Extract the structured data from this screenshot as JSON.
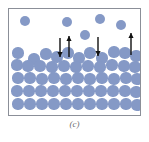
{
  "figure": {
    "caption": "(c)",
    "panel_border_color": "#8b8f98",
    "background_color": "#ffffff",
    "molecule_color": "#8599c6",
    "arrow_color": "#111111",
    "panel": {
      "x": 8,
      "y": 8,
      "width": 133,
      "height": 108
    }
  },
  "chart_data": {
    "type": "scatter",
    "title": "",
    "subtitle": "",
    "xlabel": "",
    "ylabel": "",
    "xlim": [
      0,
      133
    ],
    "ylim": [
      0,
      108
    ],
    "grid": false,
    "legend": [],
    "annotations": [
      "(c)"
    ],
    "series": [
      {
        "name": "vapor-molecules",
        "marker": "circle",
        "color": "#8599c6",
        "radius": 5.2,
        "points": [
          {
            "x": 16,
            "y": 12
          },
          {
            "x": 58,
            "y": 13
          },
          {
            "x": 91,
            "y": 10
          },
          {
            "x": 112,
            "y": 16
          },
          {
            "x": 76,
            "y": 26
          }
        ]
      },
      {
        "name": "liquid-surface-molecules",
        "marker": "circle",
        "color": "#8599c6",
        "radius": 5.6,
        "points": [
          {
            "x": 9,
            "y": 44
          },
          {
            "x": 25,
            "y": 50
          },
          {
            "x": 37,
            "y": 45
          },
          {
            "x": 48,
            "y": 48
          },
          {
            "x": 59,
            "y": 44
          },
          {
            "x": 70,
            "y": 49
          },
          {
            "x": 81,
            "y": 44
          },
          {
            "x": 93,
            "y": 49
          },
          {
            "x": 105,
            "y": 43
          },
          {
            "x": 116,
            "y": 44
          },
          {
            "x": 127,
            "y": 47
          }
        ]
      },
      {
        "name": "liquid-bulk-row-1",
        "marker": "circle",
        "color": "#8599c6",
        "radius": 5.6,
        "points": [
          {
            "x": 8,
            "y": 56
          },
          {
            "x": 19,
            "y": 57
          },
          {
            "x": 31,
            "y": 57
          },
          {
            "x": 43,
            "y": 58
          },
          {
            "x": 55,
            "y": 57
          },
          {
            "x": 67,
            "y": 58
          },
          {
            "x": 79,
            "y": 57
          },
          {
            "x": 91,
            "y": 58
          },
          {
            "x": 103,
            "y": 56
          },
          {
            "x": 115,
            "y": 57
          },
          {
            "x": 126,
            "y": 58
          }
        ]
      },
      {
        "name": "liquid-bulk-row-2",
        "marker": "circle",
        "color": "#8599c6",
        "radius": 5.6,
        "points": [
          {
            "x": 9,
            "y": 69
          },
          {
            "x": 21,
            "y": 69
          },
          {
            "x": 33,
            "y": 70
          },
          {
            "x": 45,
            "y": 69
          },
          {
            "x": 57,
            "y": 70
          },
          {
            "x": 69,
            "y": 69
          },
          {
            "x": 81,
            "y": 70
          },
          {
            "x": 93,
            "y": 69
          },
          {
            "x": 105,
            "y": 70
          },
          {
            "x": 117,
            "y": 69
          },
          {
            "x": 128,
            "y": 70
          }
        ]
      },
      {
        "name": "liquid-bulk-row-3",
        "marker": "circle",
        "color": "#8599c6",
        "radius": 5.6,
        "points": [
          {
            "x": 8,
            "y": 82
          },
          {
            "x": 20,
            "y": 82
          },
          {
            "x": 32,
            "y": 82
          },
          {
            "x": 44,
            "y": 82
          },
          {
            "x": 56,
            "y": 82
          },
          {
            "x": 68,
            "y": 82
          },
          {
            "x": 80,
            "y": 82
          },
          {
            "x": 92,
            "y": 82
          },
          {
            "x": 104,
            "y": 82
          },
          {
            "x": 116,
            "y": 82
          },
          {
            "x": 127,
            "y": 83
          }
        ]
      },
      {
        "name": "liquid-bulk-row-4",
        "marker": "circle",
        "color": "#8599c6",
        "radius": 5.6,
        "points": [
          {
            "x": 9,
            "y": 95
          },
          {
            "x": 21,
            "y": 95
          },
          {
            "x": 33,
            "y": 95
          },
          {
            "x": 45,
            "y": 95
          },
          {
            "x": 57,
            "y": 95
          },
          {
            "x": 69,
            "y": 95
          },
          {
            "x": 81,
            "y": 95
          },
          {
            "x": 93,
            "y": 95
          },
          {
            "x": 105,
            "y": 95
          },
          {
            "x": 117,
            "y": 95
          },
          {
            "x": 128,
            "y": 96
          }
        ]
      }
    ],
    "arrows": [
      {
        "name": "condensation-arrow-left",
        "direction": "down",
        "x": 51,
        "y_start": 29,
        "y_end": 48
      },
      {
        "name": "evaporation-arrow-left",
        "direction": "up",
        "x": 60,
        "y_start": 48,
        "y_end": 27
      },
      {
        "name": "condensation-arrow-right",
        "direction": "down",
        "x": 89,
        "y_start": 28,
        "y_end": 47
      },
      {
        "name": "evaporation-arrow-right",
        "direction": "up",
        "x": 122,
        "y_start": 46,
        "y_end": 24
      }
    ]
  }
}
